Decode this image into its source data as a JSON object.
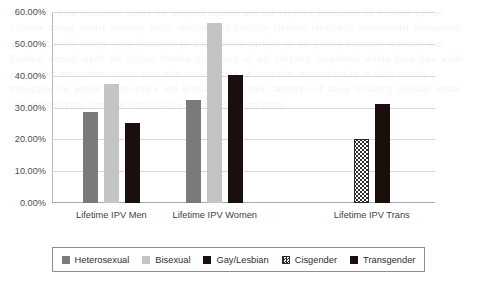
{
  "background_text": "the results were consistent across the sampled cohorts and the reported prevalence of intimate partner violence among sexual minority adults remained substantially elevated relative to heterosexual comparison groups in every survey wave examined to date. further analysis of the pooled estimates indicates that bisexual women report the highest lifetime prevalence of any subgroup considered within these data while transgender respondents report rates that exceed those of cisgender respondents by a wide margin throughout the period under review and across all measured categories of abuse including physical sexual and psychological forms of victimization reported by participants",
  "chart_data": {
    "type": "bar",
    "title": "",
    "xlabel": "",
    "ylabel": "",
    "grid": true,
    "legend_position": "bottom",
    "ylim": [
      0,
      60
    ],
    "y_tick_values": [
      0,
      10,
      20,
      30,
      40,
      50,
      60
    ],
    "y_tick_labels": [
      "0.00%",
      "10.00%",
      "20.00%",
      "30.00%",
      "40.00%",
      "50.00%",
      "60.00%"
    ],
    "categories": [
      "Lifetime IPV Men",
      "Lifetime IPV Women",
      "Lifetime IPV Trans"
    ],
    "series": [
      {
        "name": "Heterosexual",
        "color": "#7a7a7a",
        "pattern": "solid",
        "values": [
          28.7,
          32.5,
          null
        ]
      },
      {
        "name": "Bisexual",
        "color": "#c4c4c4",
        "pattern": "solid",
        "values": [
          37.5,
          56.5,
          null
        ]
      },
      {
        "name": "Gay/Lesbian",
        "color": "#1a0f0c",
        "pattern": "solid",
        "values": [
          25.0,
          40.2,
          null
        ]
      },
      {
        "name": "Cisgender",
        "color": "#2b2b2b",
        "pattern": "checker",
        "values": [
          null,
          null,
          20.0
        ]
      },
      {
        "name": "Transgender",
        "color": "#1a0f0c",
        "pattern": "solid",
        "values": [
          null,
          null,
          31.0
        ]
      }
    ]
  },
  "legend": {
    "items": [
      {
        "label": "Heterosexual"
      },
      {
        "label": "Bisexual"
      },
      {
        "label": "Gay/Lesbian"
      },
      {
        "label": "Cisgender"
      },
      {
        "label": "Transgender"
      }
    ]
  }
}
